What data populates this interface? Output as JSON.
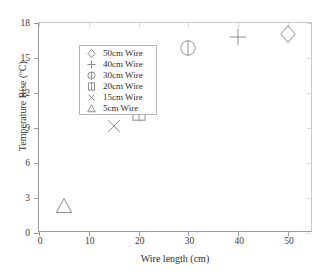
{
  "chart_data": {
    "type": "scatter",
    "title": "",
    "xlabel": "Wire length (cm)",
    "ylabel_text": "Temperature Rise (",
    "ylabel_sup": "o",
    "ylabel_tail": "C)",
    "ylabel_full": "Temperature Rise (oC)",
    "xlim": [
      0,
      55
    ],
    "ylim": [
      0,
      18
    ],
    "xticks": [
      0,
      10,
      20,
      30,
      40,
      50
    ],
    "yticks": [
      0,
      3,
      6,
      9,
      12,
      15,
      18
    ],
    "xtick_labels": [
      "0",
      "10",
      "20",
      "30",
      "40",
      "50"
    ],
    "ytick_labels": [
      "0",
      "3",
      "6",
      "9",
      "12",
      "15",
      "18"
    ],
    "grid": false,
    "legend_position": "upper-left",
    "series": [
      {
        "name": "50cm Wire",
        "marker": "diamond",
        "x": 50,
        "y": 17.1
      },
      {
        "name": "40cm Wire",
        "marker": "plus",
        "x": 40,
        "y": 16.8
      },
      {
        "name": "30cm Wire",
        "marker": "circle",
        "x": 30,
        "y": 15.9
      },
      {
        "name": "20cm Wire",
        "marker": "square",
        "x": 20,
        "y": 10.3
      },
      {
        "name": "15cm Wire",
        "marker": "cross",
        "x": 15,
        "y": 9.2
      },
      {
        "name": "5cm Wire",
        "marker": "triangle",
        "x": 5,
        "y": 2.3
      }
    ],
    "marker_color": "#8e8e8e",
    "axis_color": "#9a9a9a"
  },
  "legend": {
    "items": [
      {
        "label": "50cm Wire",
        "marker": "diamond"
      },
      {
        "label": "40cm Wire",
        "marker": "plus"
      },
      {
        "label": "30cm Wire",
        "marker": "circle"
      },
      {
        "label": "20cm Wire",
        "marker": "square"
      },
      {
        "label": "15cm Wire",
        "marker": "cross"
      },
      {
        "label": "5cm Wire",
        "marker": "triangle"
      }
    ]
  }
}
